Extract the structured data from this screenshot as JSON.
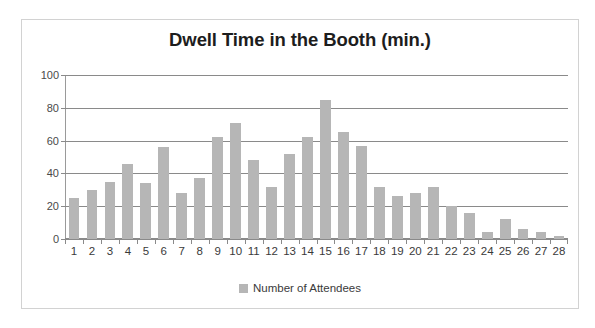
{
  "chart_data": {
    "type": "bar",
    "title": "Dwell Time in the Booth (min.)",
    "xlabel": "",
    "ylabel": "",
    "ylim": [
      0,
      100
    ],
    "ytick_labels": [
      "0",
      "20",
      "40",
      "60",
      "80",
      "100"
    ],
    "yticks": [
      0,
      20,
      40,
      60,
      80,
      100
    ],
    "grid": true,
    "legend_position": "bottom",
    "legend": [
      "Number of Attendees"
    ],
    "series_color": "#b6b6b6",
    "categories": [
      "1",
      "2",
      "3",
      "4",
      "5",
      "6",
      "7",
      "8",
      "9",
      "10",
      "11",
      "12",
      "13",
      "14",
      "15",
      "16",
      "17",
      "18",
      "19",
      "20",
      "21",
      "22",
      "23",
      "24",
      "25",
      "26",
      "27",
      "28"
    ],
    "series": [
      {
        "name": "Number of Attendees",
        "values": [
          25,
          30,
          35,
          46,
          34,
          56,
          28,
          37,
          62,
          71,
          48,
          32,
          52,
          62,
          85,
          65,
          57,
          32,
          26,
          28,
          32,
          20,
          16,
          4,
          12,
          6,
          4,
          2
        ]
      }
    ]
  },
  "legend": {
    "swatch_color": "#b6b6b6",
    "label": "Number of Attendees"
  }
}
